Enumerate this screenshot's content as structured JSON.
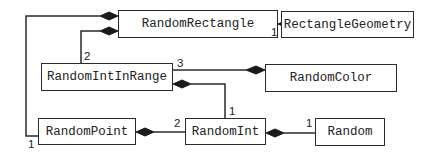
{
  "diagram": {
    "type": "uml-class-composition",
    "classes": [
      {
        "id": "random_rectangle",
        "name": "RandomRectangle"
      },
      {
        "id": "rectangle_geometry",
        "name": "RectangleGeometry"
      },
      {
        "id": "random_int_in_range",
        "name": "RandomIntInRange"
      },
      {
        "id": "random_color",
        "name": "RandomColor"
      },
      {
        "id": "random_point",
        "name": "RandomPoint"
      },
      {
        "id": "random_int",
        "name": "RandomInt"
      },
      {
        "id": "random",
        "name": "Random"
      }
    ],
    "associations": [
      {
        "whole": "RandomRectangle",
        "part": "RectangleGeometry",
        "kind": "composition",
        "multiplicity": "1"
      },
      {
        "whole": "RandomRectangle",
        "part": "RandomIntInRange",
        "kind": "composition",
        "multiplicity": "2"
      },
      {
        "whole": "RandomRectangle",
        "part": "RandomPoint",
        "kind": "composition",
        "multiplicity": "1"
      },
      {
        "whole": "RandomColor",
        "part": "RandomIntInRange",
        "kind": "composition",
        "multiplicity": "3"
      },
      {
        "whole": "RandomIntInRange",
        "part": "RandomInt",
        "kind": "composition",
        "multiplicity": "1"
      },
      {
        "whole": "RandomPoint",
        "part": "RandomInt",
        "kind": "composition",
        "multiplicity": "2"
      },
      {
        "whole": "RandomInt",
        "part": "Random",
        "kind": "composition",
        "multiplicity": "1"
      }
    ],
    "multiplicity_labels": {
      "rect_geometry": "1",
      "rect_intinrange": "2",
      "rect_point": "1",
      "color_intinrange": "3",
      "intinrange_int": "1",
      "point_int": "2",
      "int_random": "1"
    },
    "colors": {
      "line": "#2a2a2a",
      "background": "#ffffff"
    }
  }
}
